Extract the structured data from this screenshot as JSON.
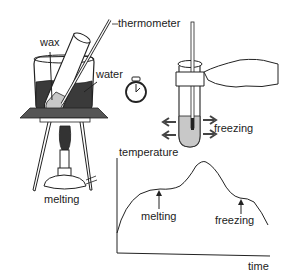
{
  "labels": {
    "thermometer": "thermometer",
    "wax": "wax",
    "water": "water",
    "freezing_tube": "freezing",
    "melting_burner": "melting",
    "graph_ylabel": "temperature",
    "graph_xlabel": "time",
    "graph_melting": "melting",
    "graph_freezing": "freezing"
  },
  "icons": {
    "stopwatch": "stopwatch-icon",
    "beaker": "beaker-icon",
    "burner": "bunsen-burner-icon",
    "tripod": "tripod-icon",
    "hand": "hand-icon",
    "test_tube": "test-tube-icon"
  },
  "colors": {
    "ink": "#222222",
    "water_fill": "#3a3a3a",
    "wax_fill": "#c8c8c8",
    "gauze": "#555555"
  },
  "graph": {
    "curve": "heating then plateau (melting), rise to peak, cooling then plateau (freezing), fall"
  }
}
